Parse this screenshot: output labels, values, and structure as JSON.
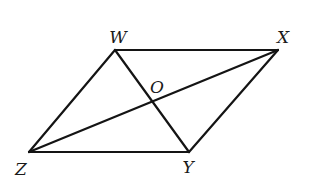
{
  "diagram": {
    "type": "parallelogram-with-diagonals",
    "stroke_color": "#141414",
    "background": "#ffffff",
    "vertices": {
      "W": {
        "x": 115,
        "y": 50
      },
      "X": {
        "x": 278,
        "y": 50
      },
      "Y": {
        "x": 189,
        "y": 152
      },
      "Z": {
        "x": 29,
        "y": 152
      },
      "O": {
        "x": 152,
        "y": 102
      }
    },
    "edges": [
      {
        "name": "side-wx",
        "from": "W",
        "to": "X"
      },
      {
        "name": "side-xy",
        "from": "X",
        "to": "Y"
      },
      {
        "name": "side-yz",
        "from": "Y",
        "to": "Z"
      },
      {
        "name": "side-zw",
        "from": "Z",
        "to": "W"
      },
      {
        "name": "diagonal-wy",
        "from": "W",
        "to": "Y"
      },
      {
        "name": "diagonal-zx",
        "from": "Z",
        "to": "X"
      }
    ],
    "labels": {
      "W": {
        "text": "W",
        "x": 118,
        "y": 37
      },
      "X": {
        "text": "X",
        "x": 283,
        "y": 37
      },
      "Y": {
        "text": "Y",
        "x": 188,
        "y": 167
      },
      "Z": {
        "text": "Z",
        "x": 21,
        "y": 169
      },
      "O": {
        "text": "O",
        "x": 157,
        "y": 87
      }
    }
  }
}
